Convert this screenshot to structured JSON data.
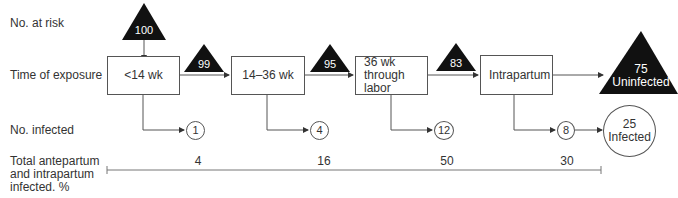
{
  "row_labels": {
    "at_risk": "No. at risk",
    "exposure": "Time of exposure",
    "infected": "No. infected",
    "total_line1": "Total antepartum",
    "total_line2": "and intrapartum",
    "total_line3": "infected. %"
  },
  "initial_at_risk": "100",
  "stages": [
    {
      "label": "<14 wk",
      "remaining": "99",
      "infected": "1",
      "percent": "4"
    },
    {
      "label": "14–36 wk",
      "remaining": "95",
      "infected": "4",
      "percent": "16"
    },
    {
      "label_lines": [
        "36 wk",
        "through",
        "labor"
      ],
      "remaining": "83",
      "infected": "12",
      "percent": "50"
    },
    {
      "label": "Intrapartum",
      "infected": "8",
      "percent": "30"
    }
  ],
  "outcomes": {
    "uninfected_count": "75",
    "uninfected_label": "Uninfected",
    "infected_count": "25",
    "infected_label": "Infected"
  },
  "colors": {
    "triangle_fill": "#111111",
    "line": "#555555",
    "text": "#333333"
  }
}
